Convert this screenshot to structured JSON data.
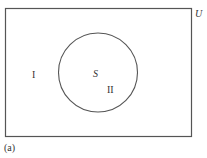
{
  "diagram": {
    "type": "venn",
    "universe_label": "U",
    "set_label": "S",
    "regions": [
      {
        "id": "outside",
        "label": "I"
      },
      {
        "id": "inside",
        "label": "II"
      }
    ],
    "caption": "(a)",
    "colors": {
      "stroke": "#555555",
      "background": "#ffffff",
      "text": "#333333"
    }
  }
}
